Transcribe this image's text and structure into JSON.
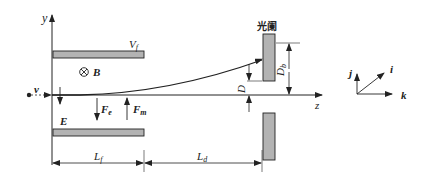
{
  "diagram": {
    "axes": {
      "y_label": "y",
      "z_label": "z"
    },
    "velocity_label": "v",
    "plates": {
      "top_label": "V",
      "top_label_sub": "f",
      "bottom_label": "E"
    },
    "magnetic_field": {
      "symbol": "⊗",
      "label": "B"
    },
    "forces": {
      "electric": {
        "label": "F",
        "sub": "e"
      },
      "magnetic": {
        "label": "F",
        "sub": "m"
      }
    },
    "aperture": {
      "label": "光阑",
      "gap_label": "D",
      "height_label": "D",
      "height_label_sub": "b"
    },
    "dimensions": {
      "field_length": {
        "label": "L",
        "sub": "f"
      },
      "drift_length": {
        "label": "L",
        "sub": "d"
      }
    },
    "unit_vectors": {
      "j": "j",
      "i": "i",
      "k": "k"
    },
    "colors": {
      "plate_fill": "#b3b3b3",
      "stroke": "#222222"
    }
  }
}
